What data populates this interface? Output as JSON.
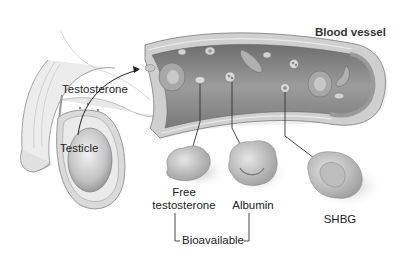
{
  "labels": {
    "testosterone": "Testosterone",
    "testicle": "Testicle",
    "blood_vessel": "Blood vessel",
    "free_testosterone_line1": "Free",
    "free_testosterone_line2": "testosterone",
    "albumin": "Albumin",
    "shbg": "SHBG",
    "bioavailable": "Bioavailable"
  },
  "colors": {
    "background": "#ffffff",
    "vessel_wall": "#c8c8c8",
    "vessel_lumen": "#8a8a8a",
    "cell": "#b5b5b5",
    "text": "#222222",
    "line": "#333333"
  }
}
